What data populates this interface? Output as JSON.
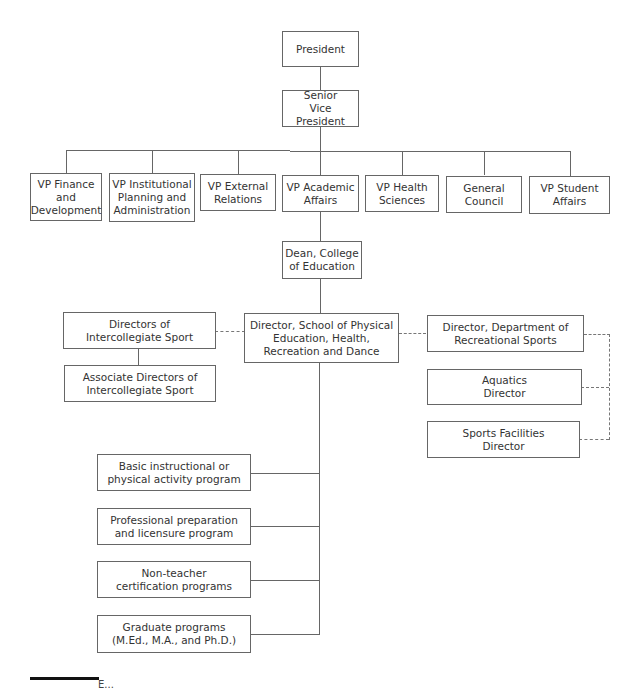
{
  "chart": {
    "type": "org-chart",
    "top": {
      "president": "President",
      "senior_vp": "Senior\nVice President"
    },
    "vps": [
      {
        "label": "VP Finance\nand\nDevelopment"
      },
      {
        "label": "VP Institutional\nPlanning and\nAdministration"
      },
      {
        "label": "VP External\nRelations"
      },
      {
        "label": "VP Academic\nAffairs"
      },
      {
        "label": "VP Health\nSciences"
      },
      {
        "label": "General\nCouncil"
      },
      {
        "label": "VP Student\nAffairs"
      }
    ],
    "dean": "Dean, College\nof Education",
    "director_school": "Director, School of Physical\nEducation, Health,\nRecreation and Dance",
    "intercollegiate": {
      "directors": "Directors of\nIntercollegiate Sport",
      "associate_directors": "Associate Directors of\nIntercollegiate Sport"
    },
    "recreational": {
      "director": "Director, Department of\nRecreational Sports",
      "aquatics": "Aquatics\nDirector",
      "facilities": "Sports Facilities\nDirector"
    },
    "programs": [
      {
        "label": "Basic instructional or\nphysical activity program"
      },
      {
        "label": "Professional preparation\nand licensure program"
      },
      {
        "label": "Non-teacher\ncertification programs"
      },
      {
        "label": "Graduate programs\n(M.Ed., M.A., and Ph.D.)"
      }
    ],
    "caption": "E..."
  }
}
